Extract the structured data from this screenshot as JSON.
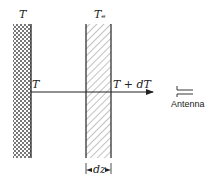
{
  "diagram": {
    "type": "radiative-transfer-slab",
    "labels": {
      "left_slab_temp": "T",
      "right_slab_temp": "Tₑ",
      "ray_start": "T",
      "ray_end": "T + dT",
      "thickness": "dz",
      "receiver": "Antenna"
    },
    "elements": [
      {
        "name": "blackbody-slab",
        "pattern": "crosshatch",
        "temperature_label": "T"
      },
      {
        "name": "absorbing-layer",
        "pattern": "diagonal-hatch",
        "temperature_label": "Tₑ",
        "thickness_label": "dz"
      },
      {
        "name": "ray-arrow",
        "direction": "right",
        "from_label": "T",
        "to_label": "T + dT"
      },
      {
        "name": "antenna",
        "label": "Antenna"
      }
    ],
    "colors": {
      "line": "#222222",
      "hatch": "#555555",
      "background": "#ffffff"
    }
  }
}
